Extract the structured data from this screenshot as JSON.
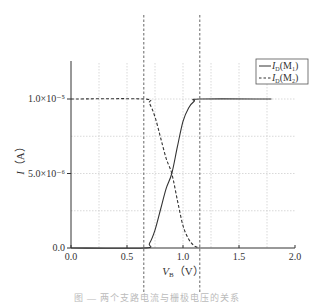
{
  "chart_data": {
    "type": "line",
    "title": "",
    "xlabel": "V_B (V)",
    "xlabel_main": "V",
    "xlabel_sub": "B",
    "xlabel_unit": "（V）",
    "ylabel": "I (A)",
    "ylabel_main": "I",
    "ylabel_unit": "（A）",
    "xlim": [
      0.0,
      2.0
    ],
    "ylim": [
      0.0,
      1.25e-05
    ],
    "x_ticks": [
      0.0,
      0.5,
      1.0,
      1.5,
      2.0
    ],
    "x_tick_labels": [
      "0.0",
      "0.5",
      "1.0",
      "1.5",
      "2.0"
    ],
    "y_ticks": [
      0.0,
      5e-06,
      1e-05
    ],
    "y_tick_labels": [
      "0.0",
      "5.0×10⁻⁶",
      "1.0×10⁻⁵"
    ],
    "grid": true,
    "grid_x": [
      0.25,
      0.5,
      0.75,
      1.0,
      1.25,
      1.5,
      1.75
    ],
    "grid_y": [
      2.5e-06,
      5e-06,
      7.5e-06,
      1e-05
    ],
    "vertical_markers": [
      0.65,
      1.15
    ],
    "legend_position": "upper right",
    "series": [
      {
        "name": "I_D(M1)",
        "label_main": "I",
        "label_sub": "D",
        "label_rest": "(M",
        "label_index": "1",
        "style": "solid",
        "x": [
          0.0,
          0.65,
          0.7,
          0.75,
          0.8,
          0.85,
          0.9,
          0.95,
          1.0,
          1.05,
          1.1,
          1.15,
          1.79
        ],
        "y": [
          0,
          0,
          3e-07,
          1.2e-06,
          2.6e-06,
          4e-06,
          5e-06,
          6.8e-06,
          8.5e-06,
          9.4e-06,
          9.85e-06,
          1e-05,
          1e-05
        ]
      },
      {
        "name": "I_D(M2)",
        "label_main": "I",
        "label_sub": "D",
        "label_rest": "(M",
        "label_index": "2",
        "style": "dashed",
        "x": [
          0.0,
          0.65,
          0.7,
          0.75,
          0.8,
          0.85,
          0.9,
          0.95,
          1.0,
          1.05,
          1.1,
          1.15
        ],
        "y": [
          1e-05,
          1e-05,
          9.7e-06,
          8.8e-06,
          7.4e-06,
          6e-06,
          5e-06,
          3.2e-06,
          1.5e-06,
          6e-07,
          1.5e-07,
          0
        ]
      }
    ]
  },
  "caption": "图 — 两个支路电流与栅极电压的关系"
}
